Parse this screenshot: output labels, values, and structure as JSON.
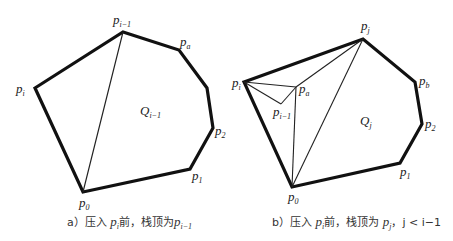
{
  "figure_a": {
    "caption_prefix": "a）压入 ",
    "caption_point": "p",
    "caption_point_sub": "i",
    "caption_middle": "前，栈顶为",
    "caption_top": "p",
    "caption_top_sub": "i−1",
    "region_label": "Q",
    "region_sub": "i−1",
    "vertices": {
      "p_i": {
        "name": "p",
        "sub": "i"
      },
      "p_im1": {
        "name": "p",
        "sub": "i−1"
      },
      "p_a": {
        "name": "p",
        "sub": "a"
      },
      "p_2": {
        "name": "p",
        "sub": "2"
      },
      "p_1": {
        "name": "p",
        "sub": "1"
      },
      "p_0": {
        "name": "p",
        "sub": "0"
      }
    }
  },
  "figure_b": {
    "caption_prefix": "b）压入 ",
    "caption_point": "p",
    "caption_point_sub": "i",
    "caption_middle": "前，栈顶为 ",
    "caption_top": "p",
    "caption_top_sub": "j",
    "caption_cond": "，j < i−1",
    "region_label": "Q",
    "region_sub": "j",
    "vertices": {
      "p_i": {
        "name": "p",
        "sub": "i"
      },
      "p_j": {
        "name": "p",
        "sub": "j"
      },
      "p_a": {
        "name": "p",
        "sub": "a"
      },
      "p_im1": {
        "name": "p",
        "sub": "i−1"
      },
      "p_b": {
        "name": "p",
        "sub": "b"
      },
      "p_2": {
        "name": "p",
        "sub": "2"
      },
      "p_1": {
        "name": "p",
        "sub": "1"
      },
      "p_0": {
        "name": "p",
        "sub": "0"
      }
    }
  }
}
